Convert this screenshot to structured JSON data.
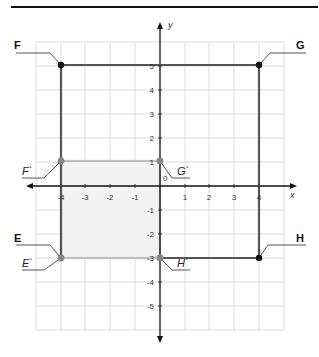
{
  "diagram": {
    "title": "",
    "axes": {
      "x_label": "x",
      "y_label": "y",
      "x_ticks": [
        "-4",
        "-3",
        "-2",
        "-1",
        "1",
        "2",
        "3",
        "4"
      ],
      "y_ticks": [
        "5",
        "4",
        "3",
        "2",
        "1",
        "-1",
        "-2",
        "-3",
        "-4",
        "-5"
      ],
      "origin_label": "0",
      "x_range": [
        -5,
        5
      ],
      "y_range": [
        -6,
        6
      ]
    },
    "original_rectangle": {
      "vertices": [
        {
          "label": "F",
          "x": -4,
          "y": 5
        },
        {
          "label": "G",
          "x": 4,
          "y": 5
        },
        {
          "label": "H",
          "x": 4,
          "y": -3
        },
        {
          "label": "E",
          "x": -4,
          "y": -3
        }
      ],
      "color": "#555555"
    },
    "image_rectangle": {
      "vertices": [
        {
          "label": "F`",
          "x": -4,
          "y": 1
        },
        {
          "label": "G`",
          "x": 0,
          "y": 1
        },
        {
          "label": "H`",
          "x": 0,
          "y": -3
        },
        {
          "label": "E`",
          "x": -4,
          "y": -3
        }
      ],
      "color": "#bbbbbb",
      "fill": "#f3f3f3"
    }
  },
  "labels": {
    "F": "F",
    "G": "G",
    "H": "H",
    "E": "E",
    "Fp": "F`",
    "Gp": "G`",
    "Hp": "H`",
    "Ep": "E`"
  }
}
